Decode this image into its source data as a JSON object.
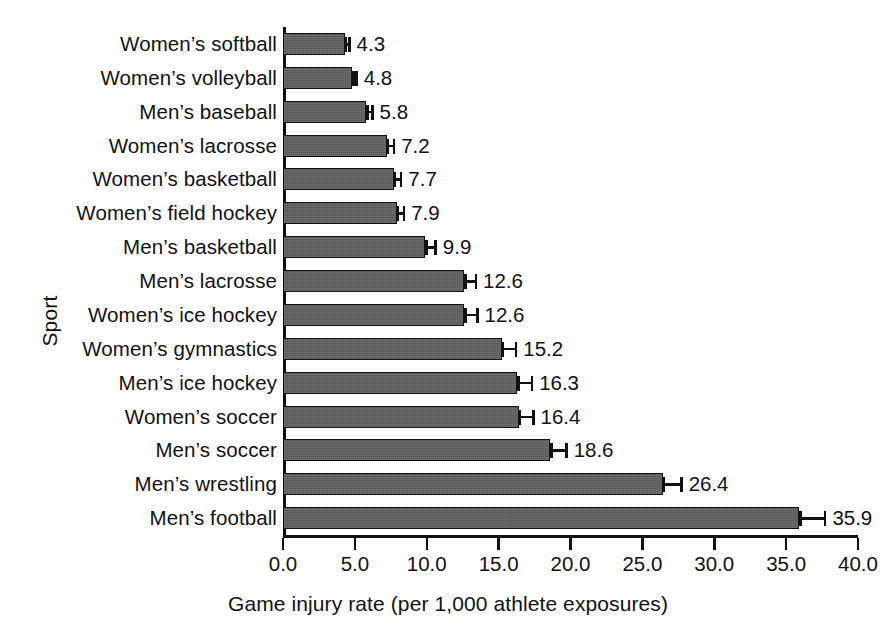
{
  "chart_data": {
    "type": "bar",
    "orientation": "horizontal",
    "title": "",
    "xlabel": "Game injury rate (per 1,000 athlete exposures)",
    "ylabel": "Sport",
    "xlim": [
      0.0,
      40.0
    ],
    "xticks": [
      "0.0",
      "5.0",
      "10.0",
      "15.0",
      "20.0",
      "25.0",
      "30.0",
      "35.0",
      "40.0"
    ],
    "xtick_values": [
      0,
      5,
      10,
      15,
      20,
      25,
      30,
      35,
      40
    ],
    "grid": false,
    "legend": null,
    "error_bars": true,
    "categories": [
      "Women’s softball",
      "Women’s volleyball",
      "Men’s baseball",
      "Women’s lacrosse",
      "Women’s basketball",
      "Women’s field hockey",
      "Men’s basketball",
      "Men’s lacrosse",
      "Women’s ice hockey",
      "Women’s gymnastics",
      "Men’s ice hockey",
      "Women’s soccer",
      "Men’s soccer",
      "Men’s wrestling",
      "Men’s football"
    ],
    "values": [
      4.3,
      4.8,
      5.8,
      7.2,
      7.7,
      7.9,
      9.9,
      12.6,
      12.6,
      15.2,
      16.3,
      16.4,
      18.6,
      26.4,
      35.9
    ],
    "value_labels": [
      "4.3",
      "4.8",
      "5.8",
      "7.2",
      "7.7",
      "7.9",
      "9.9",
      "12.6",
      "12.6",
      "15.2",
      "16.3",
      "16.4",
      "18.6",
      "26.4",
      "35.9"
    ],
    "errors": [
      0.4,
      0.4,
      0.5,
      0.6,
      0.6,
      0.6,
      0.8,
      0.9,
      1.0,
      1.1,
      1.1,
      1.1,
      1.2,
      1.4,
      1.9
    ],
    "bar_color": "#565656",
    "bar_edge_color": "#111111",
    "axis_color": "#111111"
  }
}
